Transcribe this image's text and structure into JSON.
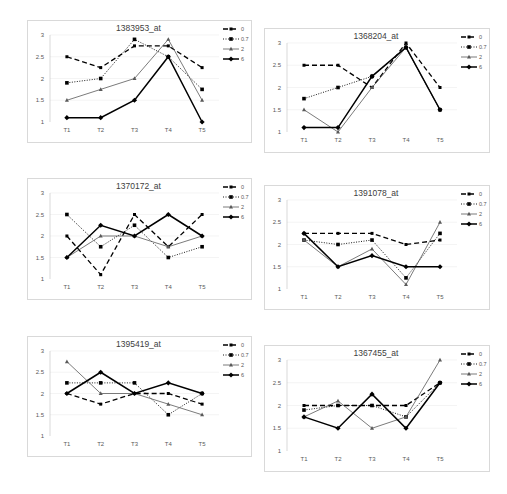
{
  "chart_data": [
    {
      "type": "line",
      "title": "1383953_at",
      "categories": [
        "T1",
        "T2",
        "T3",
        "T4",
        "T5"
      ],
      "ylim": [
        1,
        3
      ],
      "yticks": [
        "1",
        "1.5",
        "2",
        "2.5",
        "3"
      ],
      "xlabel": "",
      "ylabel": "",
      "grid": true,
      "legend": "top-right",
      "series": [
        {
          "name": "0",
          "values": [
            2.5,
            2.25,
            2.75,
            2.75,
            2.25
          ]
        },
        {
          "name": "0.7",
          "values": [
            1.9,
            2.0,
            2.9,
            2.5,
            1.75
          ]
        },
        {
          "name": "2",
          "values": [
            1.5,
            1.75,
            2.0,
            2.9,
            1.5
          ]
        },
        {
          "name": "6",
          "values": [
            1.1,
            1.1,
            1.5,
            2.5,
            1.0
          ]
        }
      ]
    },
    {
      "type": "line",
      "title": "1368204_at",
      "categories": [
        "T1",
        "T2",
        "T3",
        "T4",
        "T5"
      ],
      "ylim": [
        1,
        3
      ],
      "yticks": [
        "1",
        "1.5",
        "2",
        "2.5",
        "3"
      ],
      "xlabel": "",
      "ylabel": "",
      "grid": true,
      "legend": "top-right",
      "series": [
        {
          "name": "0",
          "values": [
            2.5,
            2.5,
            2.0,
            3.0,
            2.0
          ]
        },
        {
          "name": "0.7",
          "values": [
            1.75,
            2.0,
            2.25,
            2.9,
            1.5
          ]
        },
        {
          "name": "2",
          "values": [
            1.5,
            1.0,
            2.0,
            2.9,
            1.5
          ]
        },
        {
          "name": "6",
          "values": [
            1.1,
            1.1,
            2.25,
            2.9,
            1.5
          ]
        }
      ]
    },
    {
      "type": "line",
      "title": "1370172_at",
      "categories": [
        "T1",
        "T2",
        "T3",
        "T4",
        "T5"
      ],
      "ylim": [
        1,
        3
      ],
      "yticks": [
        "1",
        "1.5",
        "2",
        "2.5",
        "3"
      ],
      "xlabel": "",
      "ylabel": "",
      "grid": true,
      "legend": "top-right",
      "series": [
        {
          "name": "0",
          "values": [
            2.0,
            1.1,
            2.5,
            1.75,
            2.5
          ]
        },
        {
          "name": "0.7",
          "values": [
            2.5,
            1.75,
            2.25,
            1.5,
            1.75
          ]
        },
        {
          "name": "2",
          "values": [
            1.5,
            2.0,
            2.0,
            1.75,
            2.0
          ]
        },
        {
          "name": "6",
          "values": [
            1.5,
            2.25,
            2.0,
            2.5,
            2.0
          ]
        }
      ]
    },
    {
      "type": "line",
      "title": "1391078_at",
      "categories": [
        "T1",
        "T2",
        "T3",
        "T4",
        "T5"
      ],
      "ylim": [
        1,
        3
      ],
      "yticks": [
        "1",
        "1.5",
        "2",
        "2.5",
        "3"
      ],
      "xlabel": "",
      "ylabel": "",
      "grid": true,
      "legend": "top-right",
      "series": [
        {
          "name": "0",
          "values": [
            2.25,
            2.25,
            2.25,
            2.0,
            2.1
          ]
        },
        {
          "name": "0.7",
          "values": [
            2.1,
            2.0,
            2.1,
            1.25,
            2.25
          ]
        },
        {
          "name": "2",
          "values": [
            2.1,
            1.5,
            1.9,
            1.1,
            2.5
          ]
        },
        {
          "name": "6",
          "values": [
            2.25,
            1.5,
            1.75,
            1.5,
            1.5
          ]
        }
      ]
    },
    {
      "type": "line",
      "title": "1395419_at",
      "categories": [
        "T1",
        "T2",
        "T3",
        "T4",
        "T5"
      ],
      "ylim": [
        1,
        3
      ],
      "yticks": [
        "1",
        "1.5",
        "2",
        "2.5",
        "3"
      ],
      "xlabel": "",
      "ylabel": "",
      "grid": true,
      "legend": "top-right",
      "series": [
        {
          "name": "0",
          "values": [
            2.0,
            1.75,
            2.0,
            2.0,
            1.75
          ]
        },
        {
          "name": "0.7",
          "values": [
            2.25,
            2.25,
            2.25,
            1.5,
            2.0
          ]
        },
        {
          "name": "2",
          "values": [
            2.75,
            2.0,
            2.0,
            1.75,
            1.5
          ]
        },
        {
          "name": "6",
          "values": [
            2.0,
            2.5,
            2.0,
            2.25,
            2.0
          ]
        }
      ]
    },
    {
      "type": "line",
      "title": "1367455_at",
      "categories": [
        "T1",
        "T2",
        "T3",
        "T4",
        "T5"
      ],
      "ylim": [
        1,
        3
      ],
      "yticks": [
        "1",
        "1.5",
        "2",
        "2.5",
        "3"
      ],
      "xlabel": "",
      "ylabel": "",
      "grid": true,
      "legend": "top-right",
      "series": [
        {
          "name": "0",
          "values": [
            2.0,
            2.0,
            2.0,
            2.0,
            2.5
          ]
        },
        {
          "name": "0.7",
          "values": [
            1.9,
            2.0,
            2.0,
            1.75,
            2.5
          ]
        },
        {
          "name": "2",
          "values": [
            1.75,
            2.1,
            1.5,
            1.75,
            3.0
          ]
        },
        {
          "name": "6",
          "values": [
            1.75,
            1.5,
            2.25,
            1.5,
            2.5
          ]
        }
      ]
    }
  ],
  "style": {
    "series_colors": [
      "#000000",
      "#000000",
      "#595959",
      "#000000"
    ],
    "grid_color": "#ececec",
    "axis_color": "#bfbfbf"
  }
}
